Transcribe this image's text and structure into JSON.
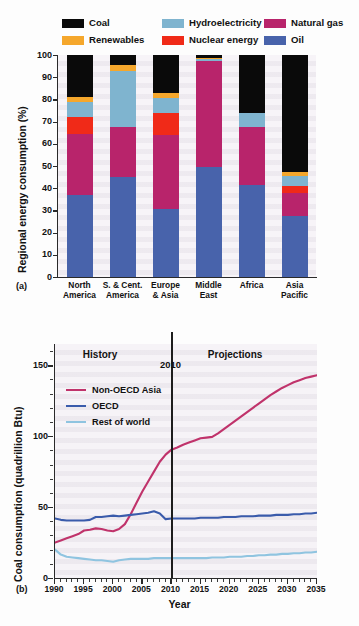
{
  "figure": {
    "panel_a_tag": "(a)",
    "panel_b_tag": "(b)"
  },
  "chart_data": [
    {
      "type": "bar",
      "id": "panel-a",
      "title": "",
      "stacked": true,
      "percent_stacked": true,
      "xlabel": "",
      "ylabel": "Regional energy consumption (%)",
      "ylim": [
        0,
        100
      ],
      "yticks": [
        0,
        10,
        20,
        30,
        40,
        50,
        60,
        70,
        80,
        90,
        100
      ],
      "grid": false,
      "legend_position": "top",
      "categories": [
        "North America",
        "S. & Cent. America",
        "Europe & Asia",
        "Middle East",
        "Africa",
        "Asia Pacific"
      ],
      "category_lines": [
        [
          "North",
          "America"
        ],
        [
          "S. & Cent.",
          "America"
        ],
        [
          "Europe",
          "& Asia"
        ],
        [
          "Middle",
          "East"
        ],
        [
          "Africa",
          ""
        ],
        [
          "Asia",
          "Pacific"
        ]
      ],
      "series": [
        {
          "name": "Oil",
          "color": "#4863ab",
          "values": [
            36.8,
            45.0,
            30.5,
            49.5,
            41.5,
            27.5
          ]
        },
        {
          "name": "Natural gas",
          "color": "#b8246b",
          "values": [
            27.8,
            22.5,
            33.5,
            48.0,
            26.0,
            10.5
          ]
        },
        {
          "name": "Nuclear energy",
          "color": "#f02a18",
          "values": [
            7.6,
            0.0,
            10.0,
            0.0,
            0.0,
            3.0
          ]
        },
        {
          "name": "Hydroelectricity",
          "color": "#7fb4cf",
          "values": [
            6.5,
            25.5,
            6.5,
            0.7,
            6.5,
            4.5
          ]
        },
        {
          "name": "Renewables",
          "color": "#f5a72c",
          "values": [
            2.3,
            2.5,
            2.5,
            0.3,
            0.0,
            2.0
          ]
        },
        {
          "name": "Coal",
          "color": "#0a0a0a",
          "values": [
            19.0,
            4.5,
            17.0,
            1.5,
            26.0,
            52.5
          ]
        }
      ],
      "legend_order": [
        "Coal",
        "Hydroelectricity",
        "Natural gas",
        "Renewables",
        "Nuclear energy",
        "Oil"
      ]
    },
    {
      "type": "line",
      "id": "panel-b",
      "title": "",
      "xlabel": "Year",
      "ylabel": "Coal consumption (quadrillion Btu)",
      "xlim": [
        1990,
        2035
      ],
      "ylim": [
        0,
        165
      ],
      "yticks": [
        0,
        50,
        100,
        150
      ],
      "xticks": [
        1990,
        1995,
        2000,
        2005,
        2010,
        2015,
        2020,
        2025,
        2030,
        2035
      ],
      "grid": false,
      "legend_position": "upper left",
      "annotations": [
        {
          "text": "History",
          "x": 1998.5,
          "y": 157
        },
        {
          "text": "Projections",
          "x": 2022,
          "y": 157
        },
        {
          "text": "2010",
          "x": 2010,
          "y": 150
        }
      ],
      "divider_year": 2010,
      "x": [
        1990,
        1991,
        1992,
        1993,
        1994,
        1995,
        1996,
        1997,
        1998,
        1999,
        2000,
        2001,
        2002,
        2003,
        2004,
        2005,
        2006,
        2007,
        2008,
        2009,
        2010,
        2011,
        2012,
        2013,
        2014,
        2015,
        2016,
        2017,
        2018,
        2019,
        2020,
        2021,
        2022,
        2023,
        2024,
        2025,
        2026,
        2027,
        2028,
        2029,
        2030,
        2031,
        2032,
        2033,
        2034,
        2035
      ],
      "series": [
        {
          "name": "Non-OECD Asia",
          "color": "#c0336b",
          "values": [
            25,
            26.5,
            28,
            29.5,
            31,
            33.5,
            34,
            35,
            34.5,
            33.5,
            33,
            34.5,
            38,
            45,
            53,
            61,
            68,
            75,
            82,
            87,
            90.5,
            92,
            94,
            95.5,
            97,
            98.5,
            99,
            99.5,
            102,
            105,
            108,
            111,
            114,
            117,
            120,
            123,
            126,
            129,
            131.5,
            134,
            136,
            138,
            139.5,
            141,
            142,
            143
          ]
        },
        {
          "name": "OECD",
          "color": "#3a5bab",
          "values": [
            42,
            41,
            40.5,
            40.5,
            40.5,
            40.5,
            41,
            43,
            43,
            43.5,
            44,
            43.5,
            44,
            44.5,
            45,
            45.5,
            46,
            47,
            45.5,
            41.5,
            42,
            42,
            42,
            42,
            42,
            42.5,
            42.5,
            42.5,
            42.5,
            43,
            43,
            43,
            43.5,
            43.5,
            43.5,
            44,
            44,
            44,
            44.5,
            44.5,
            44.5,
            45,
            45,
            45.5,
            45.5,
            46
          ]
        },
        {
          "name": "Rest of world",
          "color": "#8fc4e0",
          "values": [
            20,
            16.5,
            15,
            14.5,
            14,
            13.5,
            13,
            12.5,
            12.5,
            12,
            11.5,
            12.5,
            13,
            13.5,
            13.5,
            13.5,
            13.5,
            14,
            14,
            14,
            14,
            14,
            14,
            14,
            14,
            14,
            14,
            14.5,
            14.5,
            14.5,
            15,
            15,
            15,
            15.5,
            15.5,
            16,
            16,
            16.5,
            16.5,
            17,
            17,
            17.5,
            17.5,
            18,
            18,
            18.5
          ]
        }
      ]
    }
  ]
}
